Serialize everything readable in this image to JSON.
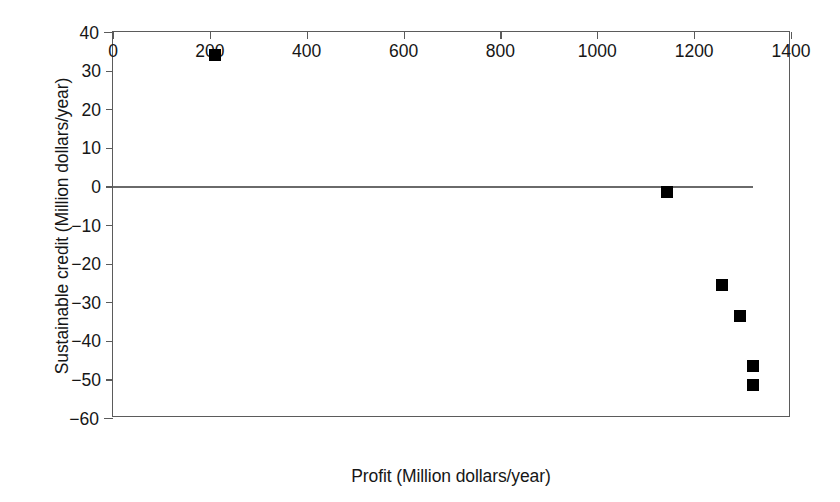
{
  "chart_data": {
    "type": "scatter",
    "title": "",
    "xlabel": "Profit (Million dollars/year)",
    "ylabel": "Sustainable credit (Million dollars/year)",
    "xlim": [
      0,
      1400
    ],
    "ylim": [
      -60,
      40
    ],
    "grid": false,
    "legend": null,
    "xticks": [
      {
        "value": 0,
        "label": "0"
      },
      {
        "value": 200,
        "label": "200"
      },
      {
        "value": 400,
        "label": "400"
      },
      {
        "value": 600,
        "label": "600"
      },
      {
        "value": 800,
        "label": "800"
      },
      {
        "value": 1000,
        "label": "1000"
      },
      {
        "value": 1200,
        "label": "1200"
      },
      {
        "value": 1400,
        "label": "1400"
      }
    ],
    "yticks": [
      {
        "value": 40,
        "label": "40"
      },
      {
        "value": 30,
        "label": "30"
      },
      {
        "value": 20,
        "label": "20"
      },
      {
        "value": 10,
        "label": "10"
      },
      {
        "value": 0,
        "label": "0"
      },
      {
        "value": -10,
        "label": "−10"
      },
      {
        "value": -20,
        "label": "−20"
      },
      {
        "value": -30,
        "label": "−30"
      },
      {
        "value": -40,
        "label": "−40"
      },
      {
        "value": -50,
        "label": "−50"
      },
      {
        "value": -60,
        "label": "−60"
      }
    ],
    "reference_lines": [
      {
        "axis": "y",
        "value": 0,
        "color": "#6a6a6a"
      }
    ],
    "series": [
      {
        "name": "Scenarios",
        "marker": "square",
        "color": "#000000",
        "points": [
          {
            "x": 211,
            "y": 34.0
          },
          {
            "x": 1144,
            "y": -1.5
          },
          {
            "x": 1257,
            "y": -25.5
          },
          {
            "x": 1295,
            "y": -33.5
          },
          {
            "x": 1322,
            "y": -46.5
          },
          {
            "x": 1322,
            "y": -51.5
          }
        ]
      }
    ]
  }
}
